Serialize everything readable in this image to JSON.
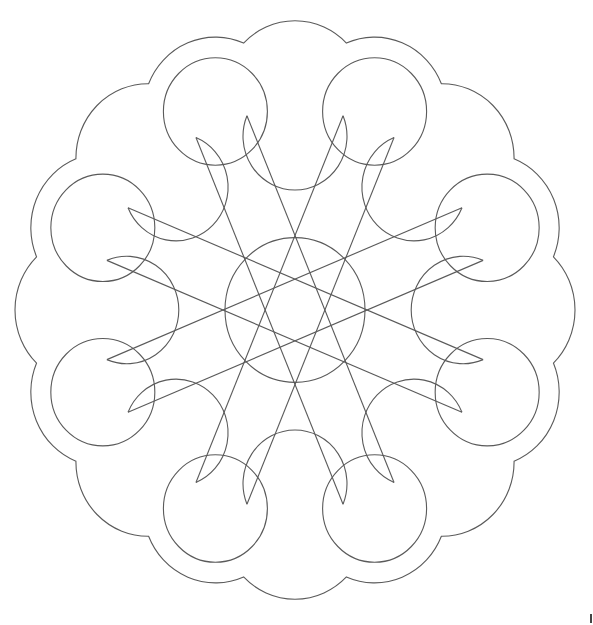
{
  "figure": {
    "stroke_color": "#5a5a5a",
    "background": "#ffffff",
    "center": [
      295,
      310
    ],
    "scale_y": 1.033,
    "center_circle_radius": 70,
    "lobe_distance": 208,
    "lobe_radius": 52,
    "border_offset": 20,
    "loops": {
      "count": 8,
      "start_angle_deg": 0,
      "step_deg": 45,
      "line_skip": 3
    },
    "circles": {
      "count": 8,
      "start_angle_deg": 22.5,
      "step_deg": 45
    }
  }
}
